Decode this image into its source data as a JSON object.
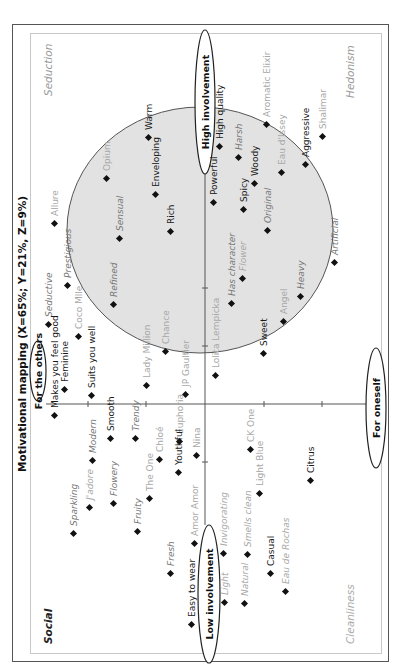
{
  "chart_data": {
    "type": "scatter",
    "title": "Motivational mapping (X=65%; Y=21%, Z=9%)",
    "orientation": "rotated 90deg counter-clockwise",
    "axes": {
      "horizontal": {
        "low_label": "Low involvement",
        "high_label": "High involvement"
      },
      "vertical": {
        "top_label": "For the others",
        "bottom_label": "For oneself"
      }
    },
    "quadrant_labels": {
      "top_left": "Social",
      "top_right": "Seduction",
      "bottom_left": "Cleanliness",
      "bottom_right": "Hedonism"
    },
    "highlight_region": {
      "shape": "circle",
      "fill": "#e0e0e0",
      "stroke": "#555555",
      "contains": "High involvement cluster"
    },
    "grid": false,
    "legend": null,
    "points": [
      {
        "label": "Allure",
        "x": 445,
        "y": 55,
        "style": "gray"
      },
      {
        "label": "Warm",
        "x": 531,
        "y": 149,
        "style": "black"
      },
      {
        "label": "Opium",
        "x": 490,
        "y": 107,
        "style": "gray"
      },
      {
        "label": "Enveloping",
        "x": 474,
        "y": 156,
        "style": "black"
      },
      {
        "label": "Powerful",
        "x": 466,
        "y": 214,
        "style": "black"
      },
      {
        "label": "High quality",
        "x": 522,
        "y": 220,
        "style": "black"
      },
      {
        "label": "Harsh",
        "x": 511,
        "y": 239,
        "style": "dgray-italic"
      },
      {
        "label": "Spicy",
        "x": 459,
        "y": 244,
        "style": "black"
      },
      {
        "label": "Woody",
        "x": 485,
        "y": 255,
        "style": "black"
      },
      {
        "label": "Aromatic Elixir",
        "x": 544,
        "y": 267,
        "style": "gray"
      },
      {
        "label": "Eau d'Issey",
        "x": 496,
        "y": 282,
        "style": "gray"
      },
      {
        "label": "Aggressive",
        "x": 504,
        "y": 306,
        "style": "black"
      },
      {
        "label": "Shalimar",
        "x": 532,
        "y": 323,
        "style": "gray"
      },
      {
        "label": "Original",
        "x": 438,
        "y": 268,
        "style": "dgray-italic"
      },
      {
        "label": "Seductive",
        "x": 344,
        "y": 49,
        "style": "dgray-italic"
      },
      {
        "label": "Prestigious",
        "x": 383,
        "y": 68,
        "style": "dgray-italic"
      },
      {
        "label": "Sensual",
        "x": 430,
        "y": 120,
        "style": "dgray-italic"
      },
      {
        "label": "Rich",
        "x": 437,
        "y": 171,
        "style": "black"
      },
      {
        "label": "Refined",
        "x": 364,
        "y": 114,
        "style": "dgray-italic"
      },
      {
        "label": "Coco Mlle",
        "x": 332,
        "y": 79,
        "style": "gray"
      },
      {
        "label": "Feminine",
        "x": 279,
        "y": 65,
        "style": "black"
      },
      {
        "label": "Suits you well",
        "x": 273,
        "y": 92,
        "style": "black"
      },
      {
        "label": "Lady Million",
        "x": 283,
        "y": 147,
        "style": "gray"
      },
      {
        "label": "Chance",
        "x": 317,
        "y": 166,
        "style": "gray"
      },
      {
        "label": "JP Gaultier",
        "x": 274,
        "y": 186,
        "style": "gray"
      },
      {
        "label": "Lolita Lempicka",
        "x": 293,
        "y": 216,
        "style": "gray"
      },
      {
        "label": "Has character",
        "x": 365,
        "y": 232,
        "style": "dgray-italic"
      },
      {
        "label": "Flower",
        "x": 390,
        "y": 243,
        "style": "gray-italic"
      },
      {
        "label": "Sweet",
        "x": 315,
        "y": 264,
        "style": "black"
      },
      {
        "label": "Angel",
        "x": 347,
        "y": 284,
        "style": "gray"
      },
      {
        "label": "Heavy",
        "x": 372,
        "y": 301,
        "style": "dgray-italic"
      },
      {
        "label": "Artificial",
        "x": 406,
        "y": 335,
        "style": "dgray-italic"
      },
      {
        "label": "Makes you feel good",
        "x": 253,
        "y": 55,
        "style": "black"
      },
      {
        "label": "Modern",
        "x": 208,
        "y": 93,
        "style": "dgray-italic"
      },
      {
        "label": "Smooth",
        "x": 230,
        "y": 111,
        "style": "black"
      },
      {
        "label": "Trendy",
        "x": 230,
        "y": 136,
        "style": "dgray-italic"
      },
      {
        "label": "Chloé",
        "x": 209,
        "y": 160,
        "style": "gray"
      },
      {
        "label": "Euphoria",
        "x": 227,
        "y": 180,
        "style": "gray"
      },
      {
        "label": "Nina",
        "x": 213,
        "y": 197,
        "style": "gray"
      },
      {
        "label": "J'adore",
        "x": 161,
        "y": 90,
        "style": "gray-italic"
      },
      {
        "label": "Sparkling",
        "x": 135,
        "y": 74,
        "style": "dgray-italic"
      },
      {
        "label": "Flowery",
        "x": 165,
        "y": 114,
        "style": "dgray-italic"
      },
      {
        "label": "The One",
        "x": 170,
        "y": 150,
        "style": "gray"
      },
      {
        "label": "Fruity",
        "x": 137,
        "y": 138,
        "style": "dgray-italic"
      },
      {
        "label": "Youthful",
        "x": 196,
        "y": 179,
        "style": "black"
      },
      {
        "label": "Amor Amor",
        "x": 125,
        "y": 195,
        "style": "gray"
      },
      {
        "label": "Fresh",
        "x": 95,
        "y": 171,
        "style": "dgray-italic"
      },
      {
        "label": "Easy to wear",
        "x": 44,
        "y": 192,
        "style": "black"
      },
      {
        "label": "CK One",
        "x": 219,
        "y": 251,
        "style": "gray"
      },
      {
        "label": "Light Blue",
        "x": 175,
        "y": 260,
        "style": "gray"
      },
      {
        "label": "Citrus",
        "x": 188,
        "y": 311,
        "style": "black"
      },
      {
        "label": "Invigorating",
        "x": 115,
        "y": 224,
        "style": "gray-italic"
      },
      {
        "label": "Smells clean",
        "x": 114,
        "y": 248,
        "style": "gray-italic"
      },
      {
        "label": "Casual",
        "x": 95,
        "y": 271,
        "style": "black"
      },
      {
        "label": "Eau de Rochas",
        "x": 77,
        "y": 286,
        "style": "gray-italic"
      },
      {
        "label": "Light",
        "x": 66,
        "y": 225,
        "style": "gray-italic"
      },
      {
        "label": "Natural",
        "x": 65,
        "y": 245,
        "style": "gray-italic"
      }
    ]
  },
  "colors": {
    "frame": "#555555",
    "inner_frame": "#c8c8c8",
    "circle_fill": "#e2e2e2",
    "black_label": "#1a1a1a",
    "gray_label": "#a8a8a8",
    "quadrant_social": "#222222",
    "quadrant_seduction": "#999999",
    "quadrant_cleanliness": "#aaaaaa",
    "quadrant_hedonism": "#999999"
  }
}
